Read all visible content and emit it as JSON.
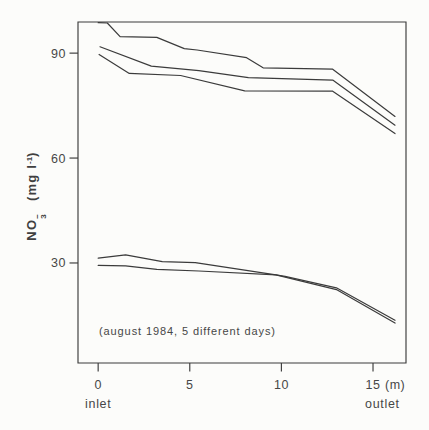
{
  "colors": {
    "line": "#3b3b3b",
    "frame": "#3b3b3b",
    "text": "#474747",
    "background": "#fcfcfa"
  },
  "chart_data": {
    "type": "line",
    "title": "",
    "annotation": "(august 1984, 5 different days)",
    "x_axis": {
      "ticks": [
        0,
        5,
        10,
        15
      ],
      "unit_label": "(m)",
      "left_label": "inlet",
      "right_label": "outlet",
      "range": [
        -1.1,
        16.8
      ],
      "grid": false
    },
    "y_axis": {
      "ticks": [
        30,
        60,
        90
      ],
      "range": [
        1.4,
        98.9
      ],
      "label": {
        "compound": "NO",
        "sub": "3",
        "sup": "−",
        "unit_pre": "(mg l",
        "unit_sup": "-1",
        "unit_close": ")"
      },
      "grid": false
    },
    "legend": "none",
    "series": [
      {
        "name": "day-1",
        "points": [
          [
            0,
            98.7
          ],
          [
            0.5,
            98.6
          ],
          [
            1.2,
            94.7
          ],
          [
            3.2,
            94.5
          ],
          [
            4.7,
            91.3
          ],
          [
            5.4,
            90.9
          ],
          [
            8.1,
            88.7
          ],
          [
            9.0,
            85.8
          ],
          [
            12.8,
            85.4
          ],
          [
            16.2,
            71.9
          ]
        ]
      },
      {
        "name": "day-2",
        "points": [
          [
            0.1,
            91.8
          ],
          [
            2.9,
            86.3
          ],
          [
            5.5,
            85.0
          ],
          [
            8.2,
            83.0
          ],
          [
            12.8,
            82.3
          ],
          [
            16.2,
            69.4
          ]
        ]
      },
      {
        "name": "day-3",
        "points": [
          [
            0.05,
            89.6
          ],
          [
            1.7,
            84.2
          ],
          [
            4.5,
            83.6
          ],
          [
            8.0,
            79.2
          ],
          [
            12.8,
            79.1
          ],
          [
            16.2,
            67.0
          ]
        ]
      },
      {
        "name": "day-4",
        "points": [
          [
            0,
            31.4
          ],
          [
            1.5,
            32.3
          ],
          [
            3.5,
            30.4
          ],
          [
            5.3,
            30.1
          ],
          [
            9.7,
            26.6
          ],
          [
            10.2,
            26.2
          ],
          [
            13,
            22.9
          ],
          [
            16.2,
            13.6
          ]
        ]
      },
      {
        "name": "day-5",
        "points": [
          [
            0,
            29.3
          ],
          [
            1.5,
            29.2
          ],
          [
            3.2,
            28.2
          ],
          [
            5.5,
            27.7
          ],
          [
            9.7,
            26.6
          ],
          [
            13,
            22.4
          ],
          [
            16.2,
            12.8
          ]
        ]
      }
    ]
  }
}
